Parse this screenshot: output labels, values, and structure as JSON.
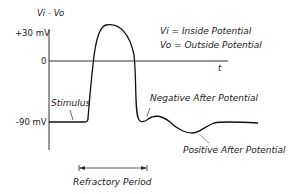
{
  "diagram": {
    "y_axis_label": "Vi - Vo",
    "x_axis_label": "t",
    "y_ticks": [
      "+30 mV",
      "0",
      "-90 mV"
    ],
    "legend": [
      "Vi = Inside Potential",
      "Vo = Outside Potential"
    ],
    "annotations": {
      "stimulus": "Stimulus",
      "negative_after": "Negative After Potential",
      "positive_after": "Positive After Potential",
      "refractory": "Refractory Period"
    }
  }
}
